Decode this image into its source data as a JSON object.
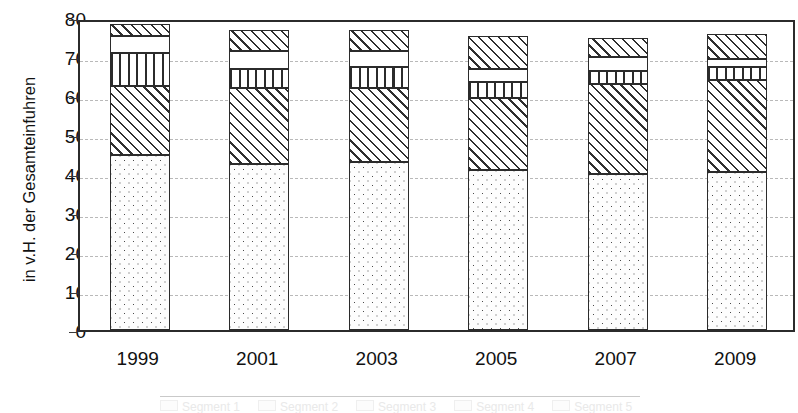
{
  "chart_data": {
    "type": "bar",
    "title": "",
    "subtitle": "",
    "xlabel": "",
    "ylabel": "in v.H. der Gesamteinfuhren",
    "categories": [
      "1999",
      "2001",
      "2003",
      "2005",
      "2007",
      "2009"
    ],
    "ylim": [
      0,
      80
    ],
    "yticks": [
      0,
      10,
      20,
      30,
      40,
      50,
      60,
      70,
      80
    ],
    "ytick_labels": [
      "0",
      "10",
      "20",
      "30",
      "40",
      "50",
      "60",
      "70",
      "80"
    ],
    "grid": true,
    "stacked": true,
    "legend_position": "bottom",
    "series": [
      {
        "name": "Segment 1",
        "pattern": "dots",
        "values": [
          45.0,
          42.5,
          43.0,
          41.0,
          40.0,
          40.5
        ]
      },
      {
        "name": "Segment 2",
        "pattern": "diagonal-hatch",
        "values": [
          17.5,
          19.5,
          19.0,
          18.5,
          23.0,
          23.5
        ]
      },
      {
        "name": "Segment 3",
        "pattern": "vertical-lines",
        "values": [
          8.5,
          5.0,
          5.5,
          4.0,
          3.5,
          3.5
        ]
      },
      {
        "name": "Segment 4",
        "pattern": "blank",
        "values": [
          4.5,
          4.5,
          4.0,
          3.5,
          3.5,
          2.0
        ]
      },
      {
        "name": "Segment 5",
        "pattern": "diagonal-hatch",
        "values": [
          3.0,
          5.5,
          5.5,
          8.5,
          5.0,
          6.5
        ]
      }
    ],
    "totals": [
      78.5,
      77.0,
      77.0,
      75.5,
      75.0,
      76.0
    ]
  },
  "axis": {
    "y_title": "in v.H. der Gesamteinfuhren"
  },
  "colors": {
    "frame": "#2b2b2b",
    "gridline": "#b9b9b9",
    "text": "#111111",
    "pattern_ink": "#2f2f2f",
    "background": "#ffffff"
  }
}
